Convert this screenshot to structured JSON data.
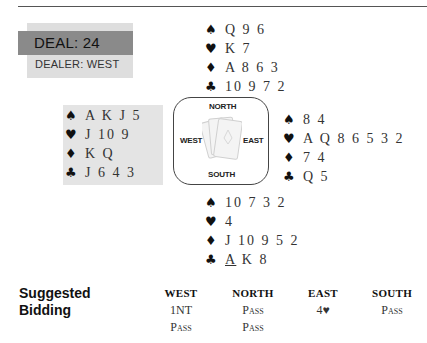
{
  "deal": {
    "label": "DEAL:  24",
    "dealer": "DEALER:  WEST"
  },
  "suits": {
    "spade": "♠",
    "heart": "♥",
    "diamond": "♦",
    "club": "♣"
  },
  "hands": {
    "north": {
      "spades": "Q 9 6",
      "hearts": "K 7",
      "diamonds": "A 8 6 3",
      "clubs": "10 9 7 2"
    },
    "west": {
      "spades": "A K J 5",
      "hearts": "J 10 9",
      "diamonds": "K Q",
      "clubs": "J 6 4 3"
    },
    "east": {
      "spades": "8 4",
      "hearts": "A Q 8 6 5 3 2",
      "diamonds": "7 4",
      "clubs": "Q 5"
    },
    "south": {
      "spades": "10 7 3 2",
      "hearts": "4",
      "diamonds": "J 10 9 5 2",
      "clubs_lead": "A",
      "clubs_rest": " K 8"
    }
  },
  "compass": {
    "north": "NORTH",
    "south": "SOUTH",
    "east": "EAST",
    "west": "WEST"
  },
  "bidding": {
    "title_line1": "Suggested",
    "title_line2": "Bidding",
    "columns": [
      {
        "header": "WEST",
        "bids": [
          "1NT",
          "Pass"
        ]
      },
      {
        "header": "NORTH",
        "bids": [
          "Pass",
          "Pass"
        ]
      },
      {
        "header": "EAST",
        "bids": [
          "4♥"
        ]
      },
      {
        "header": "SOUTH",
        "bids": [
          "Pass"
        ]
      }
    ]
  }
}
